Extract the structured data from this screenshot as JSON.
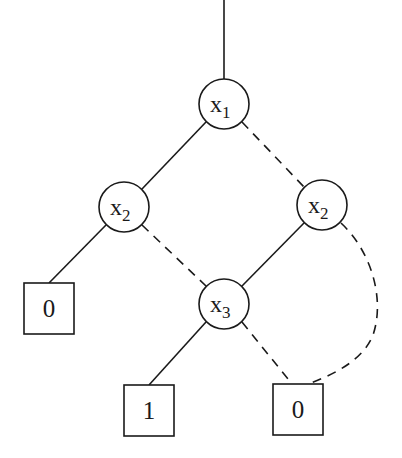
{
  "diagram": {
    "type": "binary-decision-diagram",
    "nodes": [
      {
        "id": "n1",
        "kind": "variable",
        "var": "x",
        "sub": "1"
      },
      {
        "id": "n2",
        "kind": "variable",
        "var": "x",
        "sub": "2"
      },
      {
        "id": "n3",
        "kind": "variable",
        "var": "x",
        "sub": "2"
      },
      {
        "id": "n4",
        "kind": "variable",
        "var": "x",
        "sub": "3"
      },
      {
        "id": "t0a",
        "kind": "terminal",
        "label": "0"
      },
      {
        "id": "t1",
        "kind": "terminal",
        "label": "1"
      },
      {
        "id": "t0b",
        "kind": "terminal",
        "label": "0"
      }
    ],
    "edges": [
      {
        "from": "root",
        "to": "n1",
        "style": "solid"
      },
      {
        "from": "n1",
        "to": "n2",
        "style": "solid"
      },
      {
        "from": "n1",
        "to": "n3",
        "style": "dashed"
      },
      {
        "from": "n2",
        "to": "t0a",
        "style": "solid"
      },
      {
        "from": "n2",
        "to": "n4",
        "style": "dashed"
      },
      {
        "from": "n3",
        "to": "n4",
        "style": "solid"
      },
      {
        "from": "n3",
        "to": "t0b",
        "style": "dashed"
      },
      {
        "from": "n4",
        "to": "t1",
        "style": "solid"
      },
      {
        "from": "n4",
        "to": "t0b",
        "style": "dashed"
      }
    ],
    "legend": {
      "solid": "high (1) edge",
      "dashed": "low (0) edge"
    }
  }
}
